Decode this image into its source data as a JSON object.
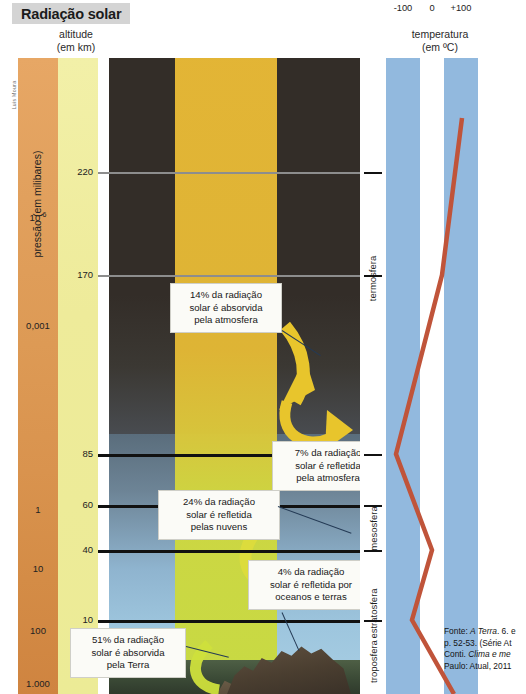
{
  "title": "Radiação solar",
  "credit": "Luis Moura",
  "columns": {
    "altitude_header_line1": "altitude",
    "altitude_header_line2": "(em km)",
    "temperature_header_line1": "temperatura",
    "temperature_header_line2": "(em ºC)"
  },
  "pressure": {
    "axis_label": "pressão (em milibares)",
    "values": [
      "10-6",
      "0,001",
      "1",
      "10",
      "100",
      "1.000"
    ]
  },
  "altitude": {
    "values": [
      "220",
      "170",
      "85",
      "60",
      "40",
      "10"
    ]
  },
  "temperature_scale": {
    "ticks": [
      "-100",
      "0",
      "+100"
    ]
  },
  "layers": [
    {
      "name": "termosfera"
    },
    {
      "name": "mesosfera"
    },
    {
      "name": "estratosfera"
    },
    {
      "name": "troposfera"
    }
  ],
  "callouts": [
    {
      "id": "absorbed-atmosphere",
      "percent": "14%",
      "line1": "14% da radiação",
      "line2": "solar é absorvida",
      "line3": "pela atmosfera"
    },
    {
      "id": "reflected-atmosphere",
      "percent": "7%",
      "line1": "7% da radiação",
      "line2": "solar é refletida",
      "line3": "pela atmosfera"
    },
    {
      "id": "reflected-clouds",
      "percent": "24%",
      "line1": "24% da radiação",
      "line2": "solar é refletida",
      "line3": "pelas nuvens"
    },
    {
      "id": "reflected-oceans-land",
      "percent": "4%",
      "line1": "4% da radiação",
      "line2": "solar é refletida por",
      "line3": "oceanos e terras"
    },
    {
      "id": "absorbed-earth",
      "percent": "51%",
      "line1": "51% da radiação",
      "line2": "solar é absorvida",
      "line3": "pela Terra"
    }
  ],
  "source": {
    "line1_a": "Fonte: ",
    "line1_b": "A Terra",
    "line1_c": ". 6. e",
    "line2": "p. 52-53. (Série At",
    "line3_a": "Conti. ",
    "line3_b": "Clima e me",
    "line4": "Paulo: Atual, 2011"
  },
  "chart_data": {
    "type": "line",
    "title": "Radiação solar",
    "xlabel": "temperatura (em ºC)",
    "ylabel": "altitude (em km)",
    "xlim": [
      -150,
      150
    ],
    "ylim": [
      0,
      260
    ],
    "xticks": [
      -100,
      0,
      100
    ],
    "yticks": [
      10,
      40,
      60,
      85,
      170,
      220
    ],
    "secondary_axis": {
      "label": "pressão (em milibares)",
      "ticks": [
        "1.000",
        "100",
        "10",
        "1",
        "0,001",
        "10-6"
      ]
    },
    "series": [
      {
        "name": "perfil térmico da atmosfera",
        "color": "#c0543a",
        "x": [
          15,
          -60,
          0,
          -90,
          40,
          120
        ],
        "y": [
          0,
          10,
          40,
          85,
          170,
          240
        ]
      }
    ],
    "annotations": [
      {
        "label": "14% da radiação solar é absorvida pela atmosfera",
        "value": 14
      },
      {
        "label": "7% da radiação solar é refletida pela atmosfera",
        "value": 7
      },
      {
        "label": "24% da radiação solar é refletida pelas nuvens",
        "value": 24
      },
      {
        "label": "4% da radiação solar é refletida por oceanos e terras",
        "value": 4
      },
      {
        "label": "51% da radiação solar é absorvida pela Terra",
        "value": 51
      }
    ],
    "layer_bands": [
      {
        "name": "troposfera",
        "range_km": [
          0,
          10
        ]
      },
      {
        "name": "estratosfera",
        "range_km": [
          10,
          50
        ]
      },
      {
        "name": "mesosfera",
        "range_km": [
          50,
          85
        ]
      },
      {
        "name": "termosfera",
        "range_km": [
          85,
          260
        ]
      }
    ],
    "grid": false,
    "legend": "none"
  }
}
